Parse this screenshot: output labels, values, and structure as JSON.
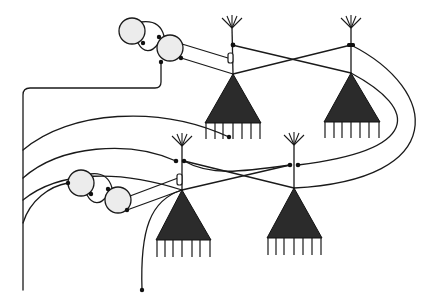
{
  "diagram": {
    "type": "neural-circuit",
    "colors": {
      "line": "#1a1a1a",
      "soma": "#2b2b2b",
      "interneuron_fill": "#ececec",
      "background": "#ffffff"
    },
    "pyramidal_neurons": [
      {
        "id": "P1",
        "stem_x": 232,
        "tuft_top": 18,
        "apex": [
          233,
          74
        ],
        "base_left": [
          205,
          123
        ],
        "base_right": [
          261,
          123
        ],
        "legs_bottom": 139
      },
      {
        "id": "P2",
        "stem_x": 351,
        "tuft_top": 17,
        "apex": [
          351,
          73
        ],
        "base_left": [
          324,
          122
        ],
        "base_right": [
          380,
          122
        ],
        "legs_bottom": 138
      },
      {
        "id": "P3",
        "stem_x": 182,
        "tuft_top": 136,
        "apex": [
          182,
          190
        ],
        "base_left": [
          156,
          240
        ],
        "base_right": [
          211,
          240
        ],
        "legs_bottom": 257
      },
      {
        "id": "P4",
        "stem_x": 294,
        "tuft_top": 134,
        "apex": [
          294,
          188
        ],
        "base_left": [
          267,
          238
        ],
        "base_right": [
          322,
          238
        ],
        "legs_bottom": 255
      }
    ],
    "interneurons": [
      {
        "id": "I1",
        "cx": 132,
        "cy": 31,
        "r": 13
      },
      {
        "id": "I2",
        "cx": 170,
        "cy": 48,
        "r": 13
      },
      {
        "id": "I3",
        "cx": 81,
        "cy": 183,
        "r": 13
      },
      {
        "id": "I4",
        "cx": 118,
        "cy": 200,
        "r": 13
      }
    ],
    "labels": []
  }
}
